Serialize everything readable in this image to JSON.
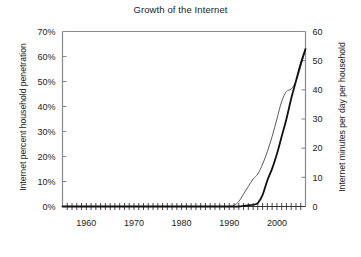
{
  "chart_data": {
    "type": "line",
    "title": "Growth of the Internet",
    "xlabel": "",
    "ylabel": "Internet percent household penetration",
    "ylabel_right": "Internet minutes per day per household",
    "xlim": [
      1955,
      2006
    ],
    "ylim": [
      0,
      70
    ],
    "ylim_right": [
      0,
      60
    ],
    "grid": false,
    "legend": "none",
    "x_tick_labels": [
      "1960",
      "1970",
      "1980",
      "1990",
      "2000"
    ],
    "x_tick_values": [
      1960,
      1970,
      1980,
      1990,
      2000
    ],
    "x_minor_tick_step": 1,
    "y_tick_labels": [
      "0%",
      "10%",
      "20%",
      "30%",
      "40%",
      "50%",
      "60%",
      "70%"
    ],
    "y_tick_values": [
      0,
      10,
      20,
      30,
      40,
      50,
      60,
      70
    ],
    "y_right_tick_labels": [
      "0",
      "10",
      "20",
      "30",
      "40",
      "50",
      "60"
    ],
    "y_right_tick_values": [
      0,
      10,
      20,
      30,
      40,
      50,
      60
    ],
    "series": [
      {
        "name": "Internet percent household penetration",
        "color": "#5a5a5a",
        "width": 1.0,
        "axis": "left",
        "x": [
          1955,
          1960,
          1965,
          1970,
          1975,
          1980,
          1985,
          1988,
          1990,
          1991,
          1992,
          1993,
          1994,
          1995,
          1996,
          1997,
          1998,
          1999,
          2000,
          2001,
          2002,
          2003,
          2004,
          2005,
          2006
        ],
        "values": [
          0,
          0,
          0,
          0,
          0,
          0,
          0,
          0,
          0,
          0.5,
          2,
          5,
          8,
          11,
          13,
          17,
          22,
          28,
          35,
          42,
          46,
          47,
          50,
          56,
          63
        ]
      },
      {
        "name": "Internet minutes per day per household",
        "color": "#111111",
        "width": 1.8,
        "axis": "right",
        "x": [
          1955,
          1960,
          1965,
          1970,
          1975,
          1980,
          1985,
          1988,
          1990,
          1992,
          1993,
          1994,
          1995,
          1996,
          1997,
          1998,
          1999,
          2000,
          2001,
          2002,
          2003,
          2004,
          2005,
          2006
        ],
        "values": [
          0,
          0,
          0,
          0,
          0,
          0,
          0,
          0,
          0,
          0,
          0.2,
          0.4,
          0.6,
          1.2,
          4,
          9,
          13,
          18,
          24,
          30,
          37,
          43,
          49,
          54
        ]
      }
    ]
  },
  "axes": {
    "left_axis_name": "percent-household-penetration-axis",
    "right_axis_name": "minutes-per-day-axis",
    "bottom_axis_name": "year-axis"
  }
}
